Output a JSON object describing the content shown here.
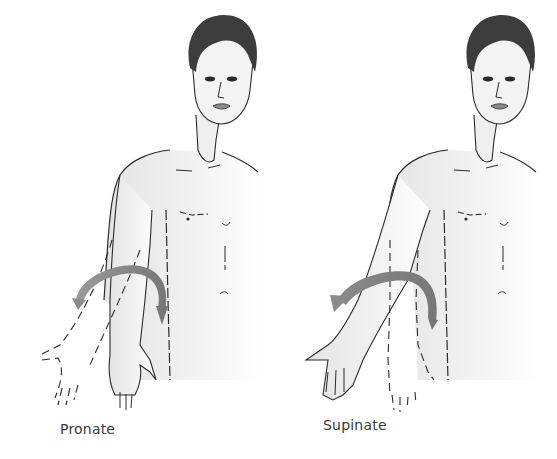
{
  "figures": [
    {
      "id": "pronate",
      "caption": "Pronate",
      "arrow_direction": "toward-body"
    },
    {
      "id": "supinate",
      "caption": "Supinate",
      "arrow_direction": "away-from-body"
    }
  ],
  "colors": {
    "background": "#ffffff",
    "line": "#2a2a2a",
    "skin_shade": "#ececec",
    "hair": "#3c3c3c",
    "arrow": "#8a8a8a",
    "caption_text": "#3a3a3a"
  }
}
